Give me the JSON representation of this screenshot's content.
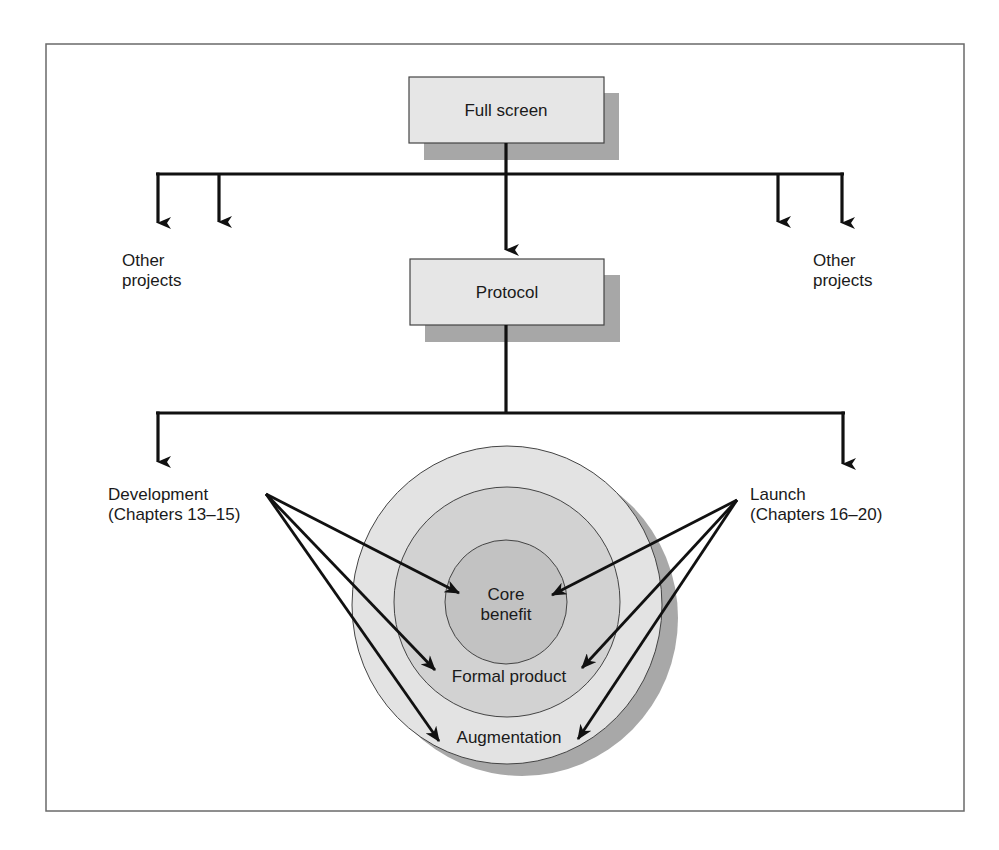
{
  "diagram": {
    "top_box": {
      "label": "Full screen"
    },
    "middle_box": {
      "label": "Protocol"
    },
    "left_others": {
      "line1": "Other",
      "line2": "projects"
    },
    "right_others": {
      "line1": "Other",
      "line2": "projects"
    },
    "development": {
      "line1": "Development",
      "line2": "(Chapters 13–15)"
    },
    "launch": {
      "line1": "Launch",
      "line2": "(Chapters 16–20)"
    },
    "rings": {
      "core": {
        "line1": "Core",
        "line2": "benefit"
      },
      "formal": {
        "label": "Formal product"
      },
      "augmentation": {
        "label": "Augmentation"
      }
    },
    "colors": {
      "box_fill": "#e6e6e6",
      "box_shadow": "#a7a7a7",
      "outer_ring": "#e3e3e3",
      "middle_ring": "#d2d2d2",
      "inner_ring": "#c2c2c2",
      "ring_shadow": "#a8a8a8",
      "line": "#111111"
    }
  }
}
